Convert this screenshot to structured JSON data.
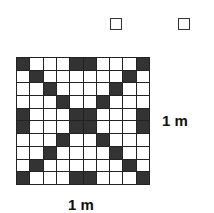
{
  "checkboxes": [
    {
      "name": "checkbox-1",
      "checked": false
    },
    {
      "name": "checkbox-2",
      "checked": false
    }
  ],
  "grid": {
    "rows": 10,
    "cols": 10,
    "dark_color": "#333333",
    "light_color": "#ffffff",
    "dark_cells": [
      [
        0,
        0
      ],
      [
        0,
        4
      ],
      [
        0,
        5
      ],
      [
        0,
        9
      ],
      [
        1,
        1
      ],
      [
        1,
        8
      ],
      [
        2,
        2
      ],
      [
        2,
        7
      ],
      [
        3,
        3
      ],
      [
        3,
        6
      ],
      [
        4,
        0
      ],
      [
        4,
        4
      ],
      [
        4,
        5
      ],
      [
        4,
        9
      ],
      [
        5,
        0
      ],
      [
        5,
        4
      ],
      [
        5,
        5
      ],
      [
        5,
        9
      ],
      [
        6,
        3
      ],
      [
        6,
        6
      ],
      [
        7,
        2
      ],
      [
        7,
        7
      ],
      [
        8,
        1
      ],
      [
        8,
        8
      ],
      [
        9,
        0
      ],
      [
        9,
        4
      ],
      [
        9,
        5
      ],
      [
        9,
        9
      ]
    ]
  },
  "labels": {
    "height": "1 m",
    "width": "1 m"
  }
}
